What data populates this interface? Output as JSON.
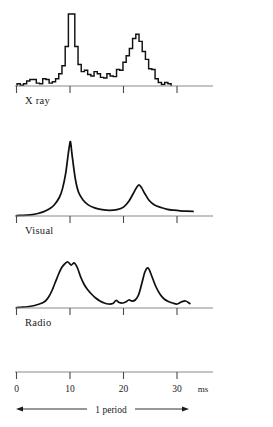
{
  "figure": {
    "panels": [
      {
        "id": "xray",
        "label": "X ray"
      },
      {
        "id": "visual",
        "label": "Visual"
      },
      {
        "id": "radio",
        "label": "Radio"
      }
    ]
  },
  "axis": {
    "unit": "ms",
    "tick_labels": [
      "0",
      "10",
      "20",
      "30"
    ],
    "tick_values": [
      0,
      10,
      20,
      30
    ],
    "range": [
      0,
      33
    ],
    "period_annotation": "1 period",
    "period_span": [
      0,
      32
    ]
  },
  "colors": {
    "trace": "#111111",
    "axis": "#8a8a8a",
    "tick": "#4a4a4a",
    "text": "#1a1a1a",
    "background": "#ffffff"
  },
  "chart_data": {
    "type": "line",
    "xlabel": "ms",
    "ylabel": "",
    "xlim": [
      0,
      33
    ],
    "grid": false,
    "legend": "none",
    "annotations": [
      "1 period"
    ],
    "panels": [
      {
        "name": "X ray",
        "type": "bar",
        "style": "histogram",
        "ylim": [
          0,
          100
        ],
        "x": [
          0.4,
          1.0,
          1.6,
          2.2,
          2.8,
          3.4,
          4.0,
          4.6,
          5.2,
          5.8,
          6.4,
          7.0,
          7.6,
          8.2,
          8.8,
          9.4,
          10.0,
          10.6,
          11.2,
          11.8,
          12.4,
          13.0,
          13.6,
          14.2,
          14.8,
          15.4,
          16.0,
          16.6,
          17.2,
          17.8,
          18.4,
          19.0,
          19.6,
          20.2,
          20.8,
          21.4,
          22.0,
          22.6,
          23.2,
          23.8,
          24.4,
          25.0,
          25.6,
          26.2,
          26.8,
          27.4,
          28.0,
          28.6
        ],
        "values": [
          3,
          1,
          3,
          7,
          9,
          9,
          4,
          3,
          10,
          9,
          4,
          6,
          10,
          17,
          28,
          55,
          100,
          100,
          55,
          30,
          20,
          22,
          16,
          14,
          20,
          17,
          12,
          11,
          17,
          14,
          13,
          23,
          22,
          33,
          42,
          52,
          66,
          72,
          62,
          48,
          37,
          24,
          23,
          10,
          5,
          2,
          5,
          3
        ]
      },
      {
        "name": "Visual",
        "type": "line",
        "style": "smooth",
        "ylim": [
          0,
          100
        ],
        "x": [
          0,
          1,
          2,
          3,
          4,
          5,
          6,
          7,
          8,
          8.6,
          9.2,
          9.6,
          9.9,
          10.1,
          10.4,
          11,
          11.6,
          12.4,
          13.4,
          14.6,
          16,
          17.4,
          18.8,
          20,
          21,
          21.8,
          22.4,
          22.9,
          23.4,
          24,
          24.8,
          25.8,
          27,
          28.2,
          29.4,
          30.6,
          31.8,
          33
        ],
        "values": [
          0.5,
          0.8,
          1.2,
          2,
          3.4,
          5.6,
          9,
          14.5,
          25,
          37,
          58,
          80,
          95,
          100,
          82,
          50,
          32,
          22,
          15,
          11,
          8.5,
          7.5,
          8.5,
          12,
          20,
          30,
          38,
          42,
          38,
          30,
          21,
          15,
          11.5,
          9,
          7.8,
          7,
          6.5,
          6.2
        ]
      },
      {
        "name": "Radio",
        "type": "line",
        "style": "smooth",
        "ylim": [
          0,
          100
        ],
        "x": [
          0,
          0.8,
          1.6,
          2.4,
          3.2,
          4,
          4.8,
          5.4,
          6,
          6.6,
          7.2,
          7.8,
          8.4,
          9,
          9.6,
          10.2,
          10.8,
          11.4,
          12,
          12.6,
          13.2,
          14,
          14.8,
          15.6,
          16.4,
          17.2,
          18,
          18.6,
          19.2,
          19.8,
          20.4,
          21,
          21.6,
          22.2,
          22.8,
          23.4,
          24,
          24.6,
          25.2,
          26,
          26.8,
          27.6,
          28.4,
          29.2,
          30,
          30.8,
          31.6,
          32.4
        ],
        "values": [
          1,
          1.5,
          2,
          3,
          4.5,
          7,
          10,
          14,
          22,
          34,
          50,
          66,
          80,
          88,
          92,
          86,
          90,
          80,
          62,
          48,
          38,
          28,
          20,
          14,
          10,
          8,
          9,
          15,
          11,
          10,
          12,
          16,
          14,
          16,
          26,
          48,
          72,
          80,
          66,
          44,
          28,
          18,
          13,
          10,
          8,
          12,
          14,
          9
        ]
      }
    ]
  }
}
